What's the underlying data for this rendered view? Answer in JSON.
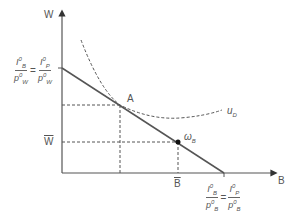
{
  "diagram": {
    "axes": {
      "y_label": "W",
      "x_label": "B"
    },
    "y_intercept_label": {
      "lhs_num": "I",
      "lhs_num_sup": "0",
      "lhs_num_sub": "B",
      "lhs_den": "p",
      "lhs_den_sup": "0",
      "lhs_den_sub": "W",
      "rhs_num": "I",
      "rhs_num_sup": "0",
      "rhs_num_sub": "P",
      "rhs_den": "p",
      "rhs_den_sup": "0",
      "rhs_den_sub": "W"
    },
    "x_intercept_label": {
      "lhs_num": "I",
      "lhs_num_sup": "0",
      "lhs_num_sub": "B",
      "lhs_den": "p",
      "lhs_den_sup": "0",
      "lhs_den_sub": "B",
      "rhs_num": "I",
      "rhs_num_sup": "0",
      "rhs_num_sub": "P",
      "rhs_den": "p",
      "rhs_den_sup": "0",
      "rhs_den_sub": "B"
    },
    "point_a_label": "A",
    "endowment_label": "ω",
    "endowment_sub": "B",
    "indifference_label": "u",
    "indifference_sub": "D",
    "w_bar_label": "W",
    "b_bar_label": "B",
    "colors": {
      "line": "#555555",
      "point": "#111111"
    }
  }
}
